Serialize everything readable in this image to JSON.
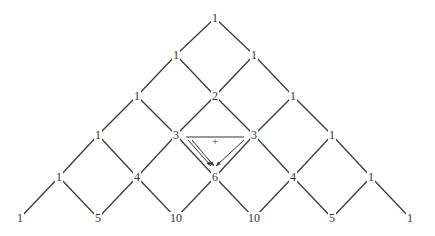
{
  "diagram": {
    "rows": [
      [
        1
      ],
      [
        1,
        1
      ],
      [
        1,
        2,
        1
      ],
      [
        1,
        3,
        3,
        1
      ],
      [
        1,
        4,
        6,
        4,
        1
      ],
      [
        1,
        5,
        10,
        10,
        5,
        1
      ]
    ],
    "annotation": {
      "operator": "+",
      "description": "3 + 3 = 6",
      "source_row": 3,
      "target_row": 4
    },
    "colors": {
      "line": "#333333",
      "text": "#333333",
      "background": "#ffffff"
    }
  }
}
